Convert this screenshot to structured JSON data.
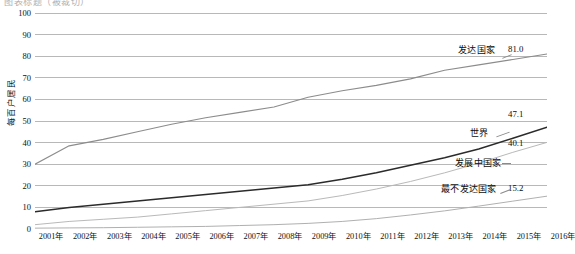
{
  "top_caption": "图表标题（被裁切）",
  "axes": {
    "y_title": "每百户居民",
    "y_ticks": [
      "0",
      "10",
      "20",
      "30",
      "40",
      "50",
      "60",
      "70",
      "80",
      "90",
      "100"
    ],
    "x_ticks": [
      "2001年",
      "2002年",
      "2003年",
      "2004年",
      "2005年",
      "2006年",
      "2007年",
      "2008年",
      "2009年",
      "2010年",
      "2011年",
      "2012年",
      "2013年",
      "2014年",
      "2015年",
      "2016年"
    ]
  },
  "annotations": {
    "developed": {
      "name": "发达国家",
      "value": "81.0"
    },
    "world": {
      "name": "世界",
      "value": "47.1"
    },
    "developing": {
      "name": "发展中国家",
      "value": "40.1"
    },
    "least_developed": {
      "name": "最不发达国家",
      "value": "15.2"
    }
  },
  "colors": {
    "developed": "#8c8c8c",
    "world": "#2b2b2b",
    "developing": "#b9b9b9",
    "least_developed": "#b0b0b0",
    "grid": "#9a9a9a",
    "axis": "#6a6a6a"
  },
  "chart_data": {
    "type": "line",
    "title": "",
    "xlabel": "",
    "ylabel": "每百户居民",
    "ylim": [
      0,
      100
    ],
    "ygrid": true,
    "ytick_step": 10,
    "legend_position": "inline-right-labels",
    "categories": [
      "2001年",
      "2002年",
      "2003年",
      "2004年",
      "2005年",
      "2006年",
      "2007年",
      "2008年",
      "2009年",
      "2010年",
      "2011年",
      "2012年",
      "2013年",
      "2014年",
      "2015年",
      "2016年"
    ],
    "series": [
      {
        "name": "发达国家",
        "end_value": 81.0,
        "values": [
          30.0,
          38.5,
          41.5,
          45.0,
          48.5,
          51.5,
          54.0,
          56.5,
          61.0,
          64.0,
          66.5,
          69.5,
          73.5,
          76.0,
          78.5,
          81.0
        ]
      },
      {
        "name": "世界",
        "end_value": 47.1,
        "values": [
          8.0,
          10.0,
          11.5,
          13.0,
          14.5,
          16.0,
          17.5,
          19.0,
          20.5,
          23.0,
          26.0,
          29.5,
          33.0,
          37.0,
          42.0,
          47.1
        ]
      },
      {
        "name": "发展中国家",
        "end_value": 40.1,
        "values": [
          2.0,
          3.5,
          4.5,
          5.5,
          7.0,
          8.5,
          10.0,
          11.5,
          13.0,
          15.5,
          18.5,
          22.0,
          26.0,
          30.5,
          35.5,
          40.1
        ]
      },
      {
        "name": "最不发达国家",
        "end_value": 15.2,
        "values": [
          0.4,
          0.5,
          0.6,
          0.8,
          1.0,
          1.2,
          1.6,
          2.0,
          2.6,
          3.5,
          4.8,
          6.5,
          8.4,
          10.6,
          12.9,
          15.2
        ]
      }
    ]
  }
}
